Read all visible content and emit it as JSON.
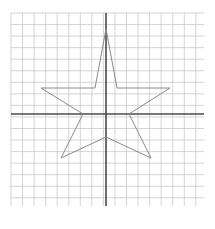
{
  "figure": {
    "title": "",
    "type": "grid-plot-star",
    "background_color": "#ffffff",
    "width": 215,
    "height": 229
  },
  "grid": {
    "visible": true,
    "line_color": "#c9c9c9",
    "line_width": 0.8,
    "cell_size": 11.55,
    "x_start": 11,
    "x_end": 204,
    "y_start": 13,
    "y_end": 206,
    "columns": 17,
    "rows": 17
  },
  "axes": {
    "line_color": "#4a4a4a",
    "line_width": 1.6,
    "x_axis": {
      "label": "",
      "y": 114,
      "x1": 11,
      "x2": 204
    },
    "y_axis": {
      "label": "",
      "x": 106,
      "y1": 13,
      "y2": 206
    },
    "origin": {
      "x": 106,
      "y": 114
    },
    "tick_labels": []
  },
  "chart_data": {
    "type": "line",
    "title": "",
    "xlabel": "",
    "ylabel": "",
    "grid": true,
    "legend": "none",
    "xlim": [
      -8.2,
      8.5
    ],
    "ylim": [
      -8.0,
      8.7
    ],
    "series": [
      {
        "name": "five-pointed-star",
        "closed": true,
        "stroke_color": "#8a8a8a",
        "stroke_width": 1.0,
        "fill": "none",
        "points_px": [
          [
            106,
            29
          ],
          [
            117,
            88
          ],
          [
            170,
            88
          ],
          [
            129,
            114
          ],
          [
            151,
            158
          ],
          [
            106,
            137
          ],
          [
            61,
            158
          ],
          [
            83,
            114
          ],
          [
            41,
            88
          ],
          [
            95,
            88
          ]
        ],
        "x": [
          0.0,
          0.95,
          5.54,
          1.99,
          3.9,
          0.0,
          -3.9,
          -1.99,
          -5.63,
          -0.95
        ],
        "y": [
          7.36,
          2.25,
          2.25,
          0.0,
          -3.81,
          -1.99,
          -3.81,
          0.0,
          2.25,
          2.25
        ]
      }
    ]
  }
}
